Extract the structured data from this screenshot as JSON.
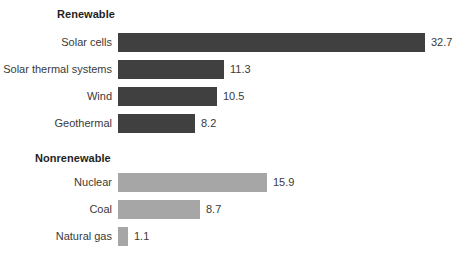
{
  "chart_data": {
    "type": "bar",
    "orientation": "horizontal",
    "title": "",
    "xlabel": "",
    "ylabel": "",
    "grid": false,
    "legend": "none",
    "xlim": [
      0,
      32.7
    ],
    "value_axis_scale_px_per_unit": 9.4,
    "groups": [
      {
        "name": "Renewable",
        "color": "#404040",
        "categories": [
          "Solar cells",
          "Solar thermal systems",
          "Wind",
          "Geothermal"
        ],
        "values": [
          32.7,
          11.3,
          10.5,
          8.2
        ]
      },
      {
        "name": "Nonrenewable",
        "color": "#a6a6a6",
        "categories": [
          "Nuclear",
          "Coal",
          "Natural gas"
        ],
        "values": [
          15.9,
          8.7,
          1.1
        ]
      }
    ],
    "categories": [
      "Solar cells",
      "Solar thermal systems",
      "Wind",
      "Geothermal",
      "Nuclear",
      "Coal",
      "Natural gas"
    ],
    "values": [
      32.7,
      11.3,
      10.5,
      8.2,
      15.9,
      8.7,
      1.1
    ]
  },
  "renewable": {
    "heading": "Renewable",
    "rows": [
      {
        "label": "Solar cells",
        "value": "32.7"
      },
      {
        "label": "Solar thermal systems",
        "value": "11.3"
      },
      {
        "label": "Wind",
        "value": "10.5"
      },
      {
        "label": "Geothermal",
        "value": "8.2"
      }
    ]
  },
  "nonrenewable": {
    "heading": "Nonrenewable",
    "rows": [
      {
        "label": "Nuclear",
        "value": "15.9"
      },
      {
        "label": "Coal",
        "value": "8.7"
      },
      {
        "label": "Natural gas",
        "value": "1.1"
      }
    ]
  },
  "colors": {
    "renewable_bar": "#404040",
    "nonrenewable_bar": "#a6a6a6",
    "background": "#ffffff",
    "text": "#3a3a3a",
    "heading_text": "#1f1f1f"
  }
}
